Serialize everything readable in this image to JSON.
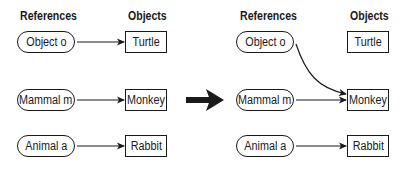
{
  "left_panel": {
    "headers": {
      "references": "References",
      "objects": "Objects"
    },
    "references": [
      "Object o",
      "Mammal m",
      "Animal a"
    ],
    "objects": [
      "Turtle",
      "Monkey",
      "Rabbit"
    ],
    "links": [
      {
        "from": "Object o",
        "to": "Turtle"
      },
      {
        "from": "Mammal m",
        "to": "Monkey"
      },
      {
        "from": "Animal a",
        "to": "Rabbit"
      }
    ]
  },
  "transition_arrow": "right-arrow",
  "right_panel": {
    "headers": {
      "references": "References",
      "objects": "Objects"
    },
    "references": [
      "Object o",
      "Mammal m",
      "Animal a"
    ],
    "objects": [
      "Turtle",
      "Monkey",
      "Rabbit"
    ],
    "links": [
      {
        "from": "Object o",
        "to": "Monkey"
      },
      {
        "from": "Mammal m",
        "to": "Monkey"
      },
      {
        "from": "Animal a",
        "to": "Rabbit"
      }
    ]
  }
}
